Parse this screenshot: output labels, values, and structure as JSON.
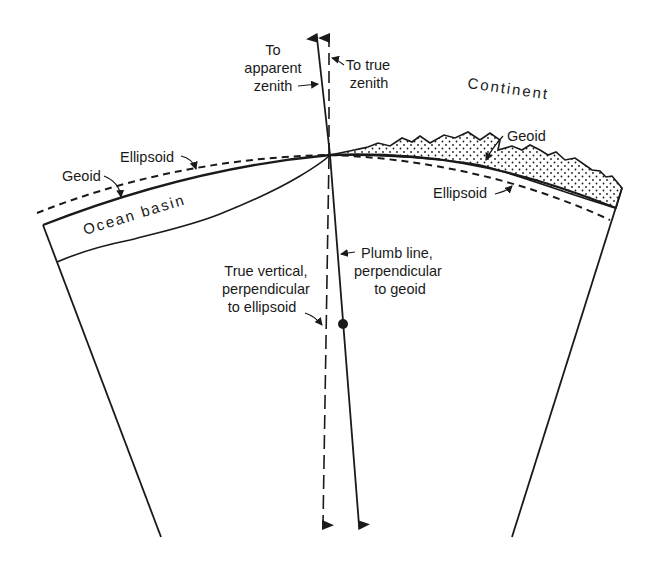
{
  "diagram": {
    "type": "geodesy-cross-section",
    "colors": {
      "ink": "#1a1a1a",
      "background": "#ffffff"
    },
    "labels": {
      "to_apparent_zenith": [
        "To",
        "apparent",
        "zenith"
      ],
      "to_true_zenith": [
        "To true",
        "zenith"
      ],
      "continent": "Continent",
      "geoid_left": "Geoid",
      "ellipsoid_left": "Ellipsoid",
      "geoid_right": "Geoid",
      "ellipsoid_right": "Ellipsoid",
      "ocean_basin": "Ocean basin",
      "plumb_line": [
        "Plumb line,",
        "perpendicular",
        "to geoid"
      ],
      "true_vertical": [
        "True vertical,",
        "perpendicular",
        "to ellipsoid"
      ]
    }
  }
}
